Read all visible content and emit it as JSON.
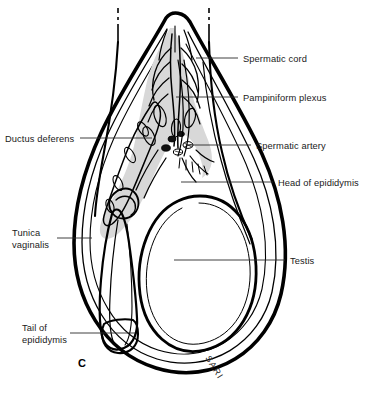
{
  "figure": {
    "panel_letter": "C",
    "signature": "SARI"
  },
  "colors": {
    "ink": "#000000",
    "background": "#ffffff",
    "plexus_fill": "#d8d8d8",
    "cord_fill": "#dcdcdc",
    "leader_line": "#2b2b2b",
    "label_text": "#1a1a1a"
  },
  "labels": [
    {
      "id": "spermatic-cord",
      "text": "Spermatic cord",
      "side": "right",
      "text_x": 243,
      "text_y": 62,
      "leader_x1": 196,
      "leader_y1": 58,
      "leader_x2": 238,
      "leader_y2": 58
    },
    {
      "id": "pampiniform-plexus",
      "text": "Pampiniform plexus",
      "side": "right",
      "text_x": 243,
      "text_y": 101,
      "leader_x1": 176,
      "leader_y1": 97,
      "leader_x2": 238,
      "leader_y2": 97
    },
    {
      "id": "ductus-deferens",
      "text": "Ductus deferens",
      "side": "left",
      "text_x": 5,
      "text_y": 142,
      "leader_x1": 80,
      "leader_y1": 138,
      "leader_x2": 152,
      "leader_y2": 138
    },
    {
      "id": "spermatic-artery",
      "text": "Spermatic artery",
      "side": "right",
      "text_x": 256,
      "text_y": 149,
      "leader_x1": 186,
      "leader_y1": 145,
      "leader_x2": 251,
      "leader_y2": 145
    },
    {
      "id": "head-of-epididymis",
      "text": "Head of epididymis",
      "side": "right",
      "text_x": 278,
      "text_y": 186,
      "leader_x1": 181,
      "leader_y1": 182,
      "leader_x2": 273,
      "leader_y2": 182
    },
    {
      "id": "tunica-vaginalis",
      "text_line1": "Tunica",
      "text_line2": "vaginalis",
      "side": "left",
      "text_x": 12,
      "text_y": 236,
      "text_y2": 248,
      "leader_x1": 57,
      "leader_y1": 238,
      "leader_x2": 92,
      "leader_y2": 238
    },
    {
      "id": "testis",
      "text": "Testis",
      "side": "right",
      "text_x": 290,
      "text_y": 264,
      "leader_x1": 174,
      "leader_y1": 260,
      "leader_x2": 285,
      "leader_y2": 260
    },
    {
      "id": "tail-of-epididymis",
      "text_line1": "Tail of",
      "text_line2": "epididymis",
      "side": "left",
      "text_x": 22,
      "text_y": 331,
      "text_y2": 343,
      "leader_x1": 70,
      "leader_y1": 333,
      "leader_x2": 135,
      "leader_y2": 333
    }
  ],
  "structures": [
    {
      "id": "scrotal-sac-outer-wall",
      "name": "Scrotal sac outer wall"
    },
    {
      "id": "tunica-vaginalis-cavity",
      "name": "Tunica vaginalis cavity"
    },
    {
      "id": "pampiniform-plexus-vessels",
      "name": "Pampiniform plexus venous network"
    },
    {
      "id": "ductus-deferens-tube",
      "name": "Ductus deferens"
    },
    {
      "id": "spermatic-artery-vessel",
      "name": "Spermatic artery"
    },
    {
      "id": "epididymis-head",
      "name": "Head of epididymis"
    },
    {
      "id": "epididymis-body",
      "name": "Body of epididymis"
    },
    {
      "id": "epididymis-tail",
      "name": "Tail of epididymis"
    },
    {
      "id": "testis-body",
      "name": "Testis"
    },
    {
      "id": "cut-edge-left",
      "name": "Cut edge marker left"
    },
    {
      "id": "cut-edge-right",
      "name": "Cut edge marker right"
    }
  ]
}
